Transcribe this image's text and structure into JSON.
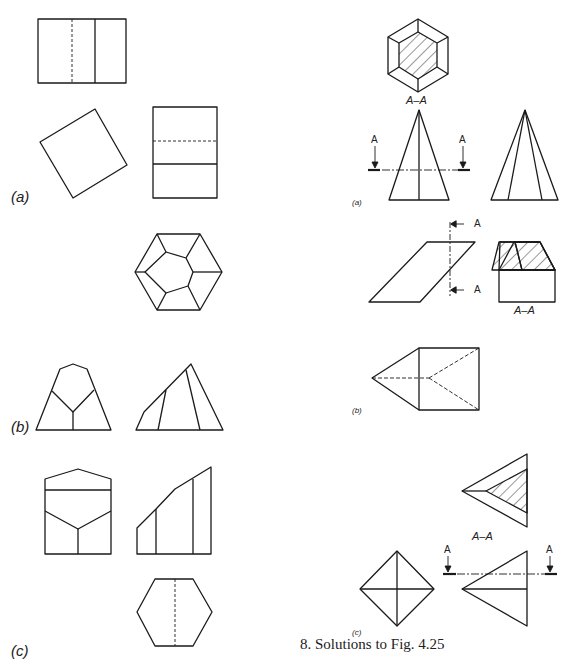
{
  "caption": "8.  Solutions to Fig. 4.25",
  "left_column": {
    "parts": [
      {
        "label": "(a)",
        "description": "rectangle with hidden line, rotated square, rectangle with dashed horizontal"
      },
      {
        "label": "(b)",
        "description": "hexagon top view, pyramid front and side views"
      },
      {
        "label": "(c)",
        "description": "pentagonal front, stepped side view, hexagon top view with hidden line"
      }
    ]
  },
  "right_column": {
    "parts": [
      {
        "label": "(a)",
        "section_label": "A–A",
        "arrow_letter": "A"
      },
      {
        "label": "(b)",
        "section_label": "A–A",
        "arrow_letter": "A"
      },
      {
        "label": "(c)",
        "section_label": "A–A",
        "arrow_letter": "A"
      }
    ]
  },
  "colors": {
    "line": "#1a1a1a",
    "background": "#ffffff"
  }
}
